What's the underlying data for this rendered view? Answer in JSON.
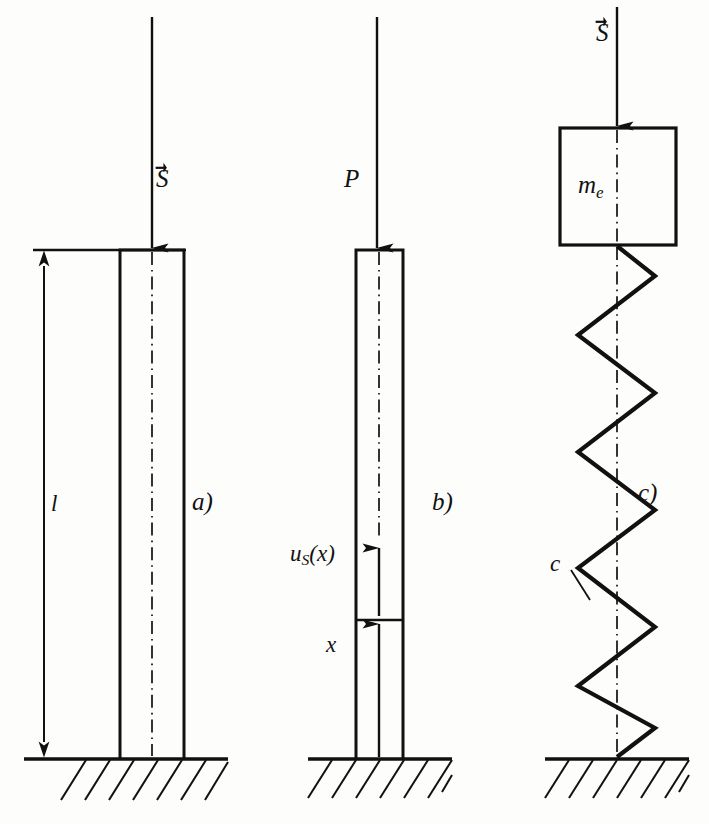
{
  "figure": {
    "background_color": "#fdfdfc",
    "ink_color": "#111111",
    "panels": [
      {
        "key": "a",
        "caption": "a)",
        "description": "Elastic column of length l loaded by axial force S",
        "labels": {
          "load": "S",
          "load_has_vector_arrow": true,
          "length": "l"
        }
      },
      {
        "key": "b",
        "caption": "b)",
        "description": "Column with axial displacement field u_S(x) at coordinate x, loaded by force P",
        "labels": {
          "load": "P",
          "load_has_vector_arrow": false,
          "displacement": "u",
          "displacement_subscript": "S",
          "displacement_argument": "(x)",
          "coordinate": "x"
        }
      },
      {
        "key": "c",
        "caption": "c)",
        "description": "Equivalent single degree of freedom: mass m_e on spring of stiffness c, loaded by S",
        "labels": {
          "load": "S",
          "load_has_vector_arrow": true,
          "mass": "m",
          "mass_subscript": "e",
          "spring_stiffness": "c"
        }
      }
    ]
  },
  "panel_a": {
    "load_label": "S",
    "length_label": "l",
    "caption": "a)"
  },
  "panel_b": {
    "load_label": "P",
    "displacement_label": "u",
    "displacement_sub": "S",
    "displacement_arg": "(x)",
    "coordinate_label": "x",
    "caption": "b)"
  },
  "panel_c": {
    "load_label": "S",
    "mass_label": "m",
    "mass_sub": "e",
    "spring_label": "c",
    "caption": "c)"
  }
}
